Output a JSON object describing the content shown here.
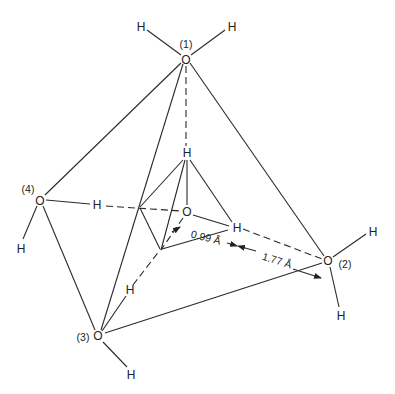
{
  "figure": {
    "atoms": {
      "oxygen_symbol": "O",
      "hydrogen_symbol": "H"
    },
    "labels": {
      "o1": "(1)",
      "o2": "(2)",
      "o3": "(3)",
      "o4": "(4)"
    },
    "measurements": {
      "covalent_bond": "0.99 Å",
      "hydrogen_bond": "1.77 Å"
    }
  }
}
